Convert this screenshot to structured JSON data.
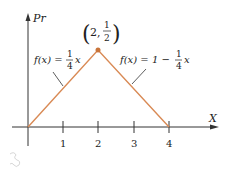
{
  "axes": {
    "y_label": "Pr",
    "x_label": "X",
    "x_ticks": [
      "1",
      "2",
      "3",
      "4"
    ]
  },
  "peak": {
    "label_x": "2,",
    "label_num": "1",
    "label_den": "2"
  },
  "left_function": {
    "lhs": "f(x) =",
    "frac_num": "1",
    "frac_den": "4",
    "var": "x"
  },
  "right_function": {
    "lhs": "f(x) = 1 −",
    "frac_num": "1",
    "frac_den": "4",
    "var": "x"
  },
  "colors": {
    "line": "#d98a55",
    "point": "#c9743a",
    "axis": "#333333"
  }
}
